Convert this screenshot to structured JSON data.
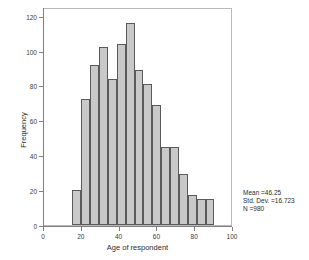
{
  "chart_data": {
    "type": "bar",
    "title": "",
    "subtitle": "",
    "xlabel": "Age of respondent",
    "ylabel": "Frequency",
    "xlim": [
      0,
      100
    ],
    "ylim": [
      0,
      125
    ],
    "grid": false,
    "legend": null,
    "bin_width": 4.7,
    "x_ticks": [
      0,
      20,
      40,
      60,
      80,
      100
    ],
    "x_tick_labels": [
      "0",
      "20",
      "40",
      "60",
      "80",
      "100"
    ],
    "y_ticks": [
      0,
      20,
      40,
      60,
      80,
      100,
      120
    ],
    "y_tick_labels": [
      "0",
      "20",
      "40",
      "60",
      "80",
      "100",
      "120"
    ],
    "bins": [
      {
        "x0": 15.0,
        "x1": 19.7,
        "value": 20
      },
      {
        "x0": 19.7,
        "x1": 24.4,
        "value": 72
      },
      {
        "x0": 24.4,
        "x1": 29.1,
        "value": 92
      },
      {
        "x0": 29.1,
        "x1": 33.8,
        "value": 102
      },
      {
        "x0": 33.8,
        "x1": 38.5,
        "value": 84
      },
      {
        "x0": 38.5,
        "x1": 43.2,
        "value": 104
      },
      {
        "x0": 43.2,
        "x1": 47.9,
        "value": 116
      },
      {
        "x0": 47.9,
        "x1": 52.6,
        "value": 89
      },
      {
        "x0": 52.6,
        "x1": 57.3,
        "value": 81
      },
      {
        "x0": 57.3,
        "x1": 62.0,
        "value": 69
      },
      {
        "x0": 62.0,
        "x1": 66.7,
        "value": 45
      },
      {
        "x0": 66.7,
        "x1": 71.4,
        "value": 45
      },
      {
        "x0": 71.4,
        "x1": 76.1,
        "value": 29
      },
      {
        "x0": 76.1,
        "x1": 80.8,
        "value": 17
      },
      {
        "x0": 80.8,
        "x1": 85.5,
        "value": 15
      },
      {
        "x0": 85.5,
        "x1": 90.2,
        "value": 15
      }
    ],
    "categories": [
      "15-19.7",
      "19.7-24.4",
      "24.4-29.1",
      "29.1-33.8",
      "33.8-38.5",
      "38.5-43.2",
      "43.2-47.9",
      "47.9-52.6",
      "52.6-57.3",
      "57.3-62",
      "62-66.7",
      "66.7-71.4",
      "71.4-76.1",
      "76.1-80.8",
      "80.8-85.5",
      "85.5-90.2"
    ],
    "values": [
      20,
      72,
      92,
      102,
      84,
      104,
      116,
      89,
      81,
      69,
      45,
      45,
      29,
      17,
      15,
      15
    ],
    "bar_fill_color": "#c9c9c9",
    "bar_edge_color": "#5a5a5a"
  },
  "annotations": {
    "mean_label": "Mean =46.25",
    "std_dev_label": "Std. Dev. =16.723",
    "n_label": "N =980"
  }
}
